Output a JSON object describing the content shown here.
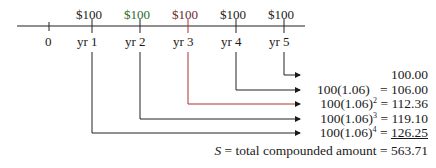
{
  "timeline": {
    "ticks": [
      {
        "label": "0",
        "payment": ""
      },
      {
        "label": "yr 1",
        "payment": "$100"
      },
      {
        "label": "yr 2",
        "payment": "$100"
      },
      {
        "label": "yr 3",
        "payment": "$100"
      },
      {
        "label": "yr 4",
        "payment": "$100"
      },
      {
        "label": "yr 5",
        "payment": "$100"
      }
    ]
  },
  "rows": [
    {
      "expr": "",
      "value": "100.00",
      "from": "yr 5"
    },
    {
      "expr": "100(1.06)",
      "eq": "=",
      "value": "106.00",
      "from": "yr 4"
    },
    {
      "expr": "100(1.06)",
      "exp": "2",
      "eq": "=",
      "value": "112.36",
      "from": "yr 3"
    },
    {
      "expr": "100(1.06)",
      "exp": "3",
      "eq": "=",
      "value": "119.10",
      "from": "yr 2"
    },
    {
      "expr": "100(1.06)",
      "exp": "4",
      "eq": "=",
      "value": "126.25",
      "from": "yr 1"
    }
  ],
  "total": {
    "symbol": "S",
    "label": "= total compounded amount =",
    "value": "563.71"
  }
}
